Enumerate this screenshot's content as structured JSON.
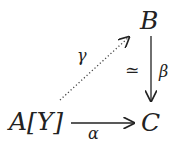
{
  "diagram": {
    "type": "commutative-diagram",
    "nodes": {
      "A": "A[Y]",
      "B": "B",
      "C": "C"
    },
    "arrows": [
      {
        "from": "A",
        "to": "C",
        "label": "α",
        "style": "solid"
      },
      {
        "from": "B",
        "to": "C",
        "label": "β",
        "style": "solid",
        "annotation": "≃"
      },
      {
        "from": "A",
        "to": "B",
        "label": "γ",
        "style": "dotted"
      }
    ]
  }
}
